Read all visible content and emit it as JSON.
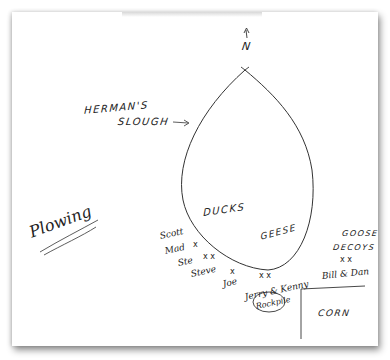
{
  "map": {
    "north_label": "N",
    "slough_label_line1": "HERMAN'S",
    "slough_label_line2": "SLOUGH",
    "water_labels": {
      "ducks": "DUCKS",
      "geese": "GEESE"
    },
    "field_labels": {
      "plowing": "Plowing",
      "corn": "CORN",
      "goose_decoys_line1": "GOOSE",
      "goose_decoys_line2": "DECOYS"
    },
    "hunters": [
      {
        "name": "Scott",
        "marker": ""
      },
      {
        "name": "Mad",
        "marker": "x"
      },
      {
        "name": "Ste",
        "marker": "x"
      },
      {
        "name": "Steve",
        "marker": "x"
      },
      {
        "name": "Joe",
        "marker": "x"
      },
      {
        "name": "Jerry",
        "marker": "x"
      },
      {
        "name": "Kenny",
        "marker": "x"
      },
      {
        "name": "Bill",
        "marker": "x"
      },
      {
        "name": "Dan",
        "marker": "x"
      }
    ],
    "hunter_labels": {
      "scott": "Scott",
      "mad": "Mad",
      "ste": "Ste",
      "steve": "Steve",
      "joe": "Joe",
      "jerry_kenny": "Jerry & Kenny",
      "bill_dan": "Bill & Dan",
      "rookpile": "Rockpile"
    },
    "marker_glyph": "x",
    "x_pair": "x x"
  },
  "colors": {
    "ink": "#222222",
    "paper": "#ffffff",
    "shadow": "#9a9a9a"
  }
}
